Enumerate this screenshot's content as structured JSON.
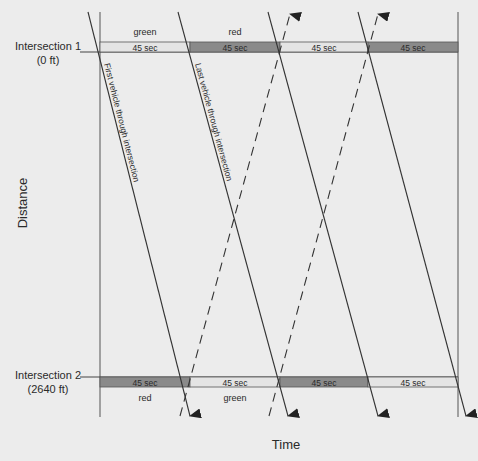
{
  "intersection1": {
    "name": "Intersection 1",
    "distance": "(0 ft)"
  },
  "intersection2": {
    "name": "Intersection 2",
    "distance": "(2640 ft)"
  },
  "axes": {
    "x_label": "Time",
    "y_label": "Distance"
  },
  "phase_duration": "45 sec",
  "int1_phases": [
    {
      "state": "green",
      "label": "45 sec"
    },
    {
      "state": "red",
      "label": "45 sec"
    },
    {
      "state": "green",
      "label": "45 sec"
    },
    {
      "state": "red",
      "label": "45 sec"
    }
  ],
  "int2_phases": [
    {
      "state": "red",
      "label": "45 sec"
    },
    {
      "state": "green",
      "label": "45 sec"
    },
    {
      "state": "red",
      "label": "45 sec"
    },
    {
      "state": "green",
      "label": "45 sec"
    }
  ],
  "phase_text": {
    "top_green": "green",
    "top_red": "red",
    "bottom_red": "red",
    "bottom_green": "green"
  },
  "annotations": {
    "first_vehicle": "First vehicle through intersection",
    "last_vehicle": "Last vehicle through intersection"
  },
  "colors": {
    "green_phase": "#e4e4e4",
    "red_phase": "#8a8a8a",
    "line": "#333333",
    "background": "#ececec"
  }
}
